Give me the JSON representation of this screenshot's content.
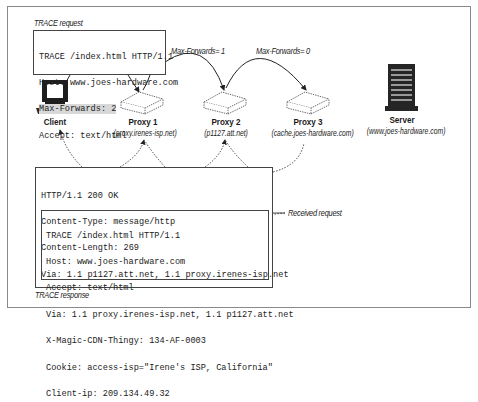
{
  "figure": {
    "request_caption": "TRACE request",
    "response_caption": "TRACE response",
    "received_caption": "Received request",
    "hop_labels": [
      "Max-Forwards= 1",
      "Max-Forwards= 0"
    ]
  },
  "request": {
    "lines": [
      "TRACE /index.html HTTP/1.1",
      "Host: www.joes-hardware.com",
      "Max-Forwards: 2",
      "Accept: text/html"
    ],
    "highlighted_line_index": 2
  },
  "nodes": [
    {
      "name": "Client",
      "host": "",
      "icon": "computer-icon"
    },
    {
      "name": "Proxy 1",
      "host": "(proxy.irenes-isp.net)",
      "icon": "proxy-box-icon"
    },
    {
      "name": "Proxy 2",
      "host": "(p1127.att.net)",
      "icon": "proxy-box-icon"
    },
    {
      "name": "Proxy 3",
      "host": "(cache.joes-hardware.com)",
      "icon": "proxy-box-icon"
    },
    {
      "name": "Server",
      "host": "(www.joes-hardware.com)",
      "icon": "server-icon"
    }
  ],
  "response": {
    "headers": [
      "HTTP/1.1 200 OK",
      "Content-Type: message/http",
      "Content-Length: 269",
      "Via: 1.1 p1127.att.net, 1.1 proxy.irenes-isp.net"
    ],
    "body": [
      "TRACE /index.html HTTP/1.1",
      "Host: www.joes-hardware.com",
      "Accept: text/html",
      "Via: 1.1 proxy.irenes-isp.net, 1.1 p1127.att.net",
      "X-Magic-CDN-Thingy: 134-AF-0003",
      "Cookie: access-isp=\"Irene's ISP, California\"",
      "Client-ip: 209.134.49.32"
    ]
  },
  "colors": {
    "frame": "#8a8a8a",
    "highlight": "#d8d8d8",
    "icon_dark": "#222222"
  }
}
